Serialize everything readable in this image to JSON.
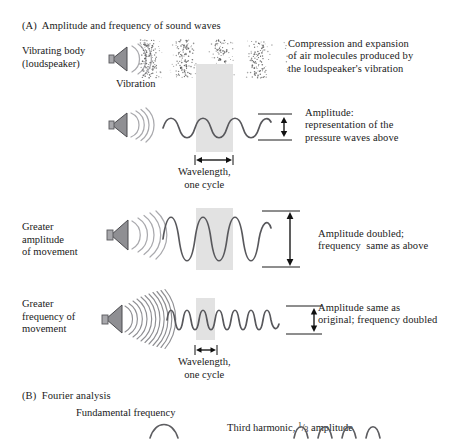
{
  "figure": {
    "panel_a": {
      "title": "(A)  Amplitude and frequency of sound waves",
      "rows": [
        {
          "id": "row-pressure-wave",
          "left_label": "Vibrating body\n(loudspeaker)",
          "under_label": "Vibration",
          "right_text": "Compression and expansion\nof air molecules produced by\nthe loudspeaker's vibration",
          "speaker_arcs": 3,
          "depiction": "dot-field-compression-rarefaction",
          "compression_bands": 4
        },
        {
          "id": "row-baseline-wave",
          "left_label": "",
          "right_text": "Amplitude:\nrepresentation of the\npressure waves above",
          "speaker_arcs": 4,
          "wave": {
            "cycles": 3,
            "amplitude": "1x",
            "frequency": "1x"
          },
          "wavelength_label": "Wavelength,\none cycle",
          "amplitude_marker": "small-double-arrow"
        },
        {
          "id": "row-greater-amplitude",
          "left_label": "Greater\namplitude\nof movement",
          "right_text": "Amplitude doubled;\nfrequency  same as above",
          "speaker_arcs": 5,
          "wave": {
            "cycles": 3,
            "amplitude": "2x",
            "frequency": "1x"
          },
          "amplitude_marker": "large-double-arrow"
        },
        {
          "id": "row-greater-frequency",
          "left_label": "Greater\nfrequency of\nmovement",
          "right_text": "Amplitude same as\noriginal; frequency doubled",
          "speaker_arcs": 11,
          "wave": {
            "cycles": 6,
            "amplitude": "1x",
            "frequency": "2x"
          },
          "wavelength_label": "Wavelength,\none cycle",
          "amplitude_marker": "small-double-arrow"
        }
      ]
    },
    "panel_b": {
      "title": "(B)  Fourier analysis",
      "captions": [
        {
          "id": "fundamental",
          "text": "Fundamental frequency"
        },
        {
          "id": "third-harmonic",
          "text_before": "Third harmonic, ",
          "numerator": "1",
          "slash": "/",
          "denominator": "3",
          "text_after": " amplitude"
        }
      ]
    },
    "colors": {
      "band_gray": "#e2e2e2",
      "wave_stroke": "#58585c",
      "arc_gray": "#a9a9ad",
      "cone_gray": "#8f8f93",
      "text": "#1a1a1a"
    }
  }
}
